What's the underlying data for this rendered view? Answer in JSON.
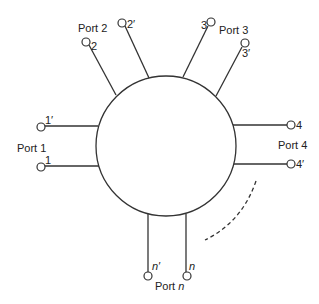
{
  "diagram": {
    "type": "n-port network",
    "junction": {
      "shape": "circle",
      "cx": 166,
      "cy": 146,
      "r": 70
    },
    "ports": [
      {
        "name": "Port 1",
        "terminals": [
          "1'",
          "1"
        ]
      },
      {
        "name": "Port 2",
        "terminals": [
          "2",
          "2'"
        ]
      },
      {
        "name": "Port 3",
        "terminals": [
          "3",
          "3'"
        ]
      },
      {
        "name": "Port 4",
        "terminals": [
          "4",
          "4'"
        ]
      },
      {
        "name": "Port n",
        "name_prefix": "Port ",
        "name_italic": "n",
        "terminals": [
          "n'",
          "n"
        ]
      }
    ],
    "continuation": "dashed arc indicating additional ports"
  },
  "labels": {
    "port1": "Port 1",
    "port2": "Port 2",
    "port3": "Port 3",
    "port4": "Port 4",
    "portn_prefix": "Port ",
    "portn_italic": "n",
    "t1p": "1′",
    "t1": "1",
    "t2": "2",
    "t2p": "2′",
    "t3": "3",
    "t3p": "3′",
    "t4": "4",
    "t4p": "4′",
    "tnp": "n′",
    "tn": "n"
  },
  "colors": {
    "stroke": "#333333",
    "text": "#222222",
    "background": "#ffffff"
  }
}
